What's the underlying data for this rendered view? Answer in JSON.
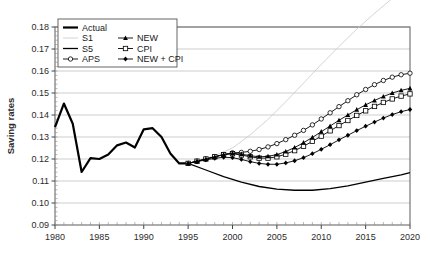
{
  "chart_data": {
    "type": "line",
    "title": "",
    "xlabel": "",
    "ylabel": "Saving rates",
    "xlim": [
      1980,
      2020
    ],
    "ylim": [
      0.09,
      0.18
    ],
    "yticks": [
      "0.09",
      "0.10",
      "0.11",
      "0.12",
      "0.13",
      "0.14",
      "0.15",
      "0.16",
      "0.17",
      "0.18"
    ],
    "xticks": [
      "1980",
      "1985",
      "1990",
      "1995",
      "2000",
      "2005",
      "2010",
      "2015",
      "2020"
    ],
    "x_minor_tick_step": 1,
    "grid": "horizontal",
    "legend_position": "top-left-inside",
    "legend_entries": [
      {
        "label": "Actual",
        "style": "thick-line",
        "marker": "none",
        "color": "#000000"
      },
      {
        "label": "S1",
        "style": "thin-line",
        "marker": "none",
        "color": "#c9c9c9"
      },
      {
        "label": "S5",
        "style": "medium-line",
        "marker": "none",
        "color": "#000000"
      },
      {
        "label": "APS",
        "style": "line-with-marker",
        "marker": "open-circle",
        "color": "#000000"
      },
      {
        "label": "NEW",
        "style": "line-with-marker",
        "marker": "filled-triangle",
        "color": "#000000"
      },
      {
        "label": "CPI",
        "style": "line-with-marker",
        "marker": "open-square",
        "color": "#000000"
      },
      {
        "label": "NEW + CPI",
        "style": "line-with-marker",
        "marker": "filled-diamond",
        "color": "#000000"
      }
    ],
    "series": [
      {
        "name": "Actual",
        "x": [
          1980,
          1981,
          1982,
          1983,
          1984,
          1985,
          1986,
          1987,
          1988,
          1989,
          1990,
          1991,
          1992,
          1993,
          1994,
          1995
        ],
        "values": [
          0.1345,
          0.1452,
          0.136,
          0.1141,
          0.1204,
          0.12,
          0.122,
          0.1262,
          0.1275,
          0.1252,
          0.1335,
          0.134,
          0.13,
          0.1225,
          0.118,
          0.118
        ]
      },
      {
        "name": "S1",
        "x": [
          1995,
          1998,
          2000,
          2002,
          2004,
          2006,
          2008,
          2010,
          2012,
          2014,
          2016,
          2018,
          2020
        ],
        "values": [
          0.118,
          0.1215,
          0.125,
          0.131,
          0.138,
          0.146,
          0.1545,
          0.163,
          0.1712,
          0.179,
          0.1862,
          0.193,
          0.1995
        ]
      },
      {
        "name": "S5",
        "x": [
          1995,
          1997,
          1999,
          2001,
          2003,
          2005,
          2007,
          2009,
          2011,
          2013,
          2015,
          2017,
          2019,
          2020
        ],
        "values": [
          0.118,
          0.115,
          0.112,
          0.1095,
          0.1075,
          0.1063,
          0.1058,
          0.1058,
          0.1065,
          0.1078,
          0.1095,
          0.1112,
          0.1128,
          0.1138
        ]
      },
      {
        "name": "APS",
        "x": [
          1995,
          1996,
          1997,
          1998,
          1999,
          2000,
          2001,
          2002,
          2003,
          2004,
          2005,
          2006,
          2007,
          2008,
          2009,
          2010,
          2011,
          2012,
          2013,
          2014,
          2015,
          2016,
          2017,
          2018,
          2019,
          2020
        ],
        "values": [
          0.118,
          0.119,
          0.12,
          0.121,
          0.122,
          0.1228,
          0.123,
          0.1235,
          0.1243,
          0.1255,
          0.127,
          0.1288,
          0.1308,
          0.133,
          0.1355,
          0.1382,
          0.141,
          0.1438,
          0.1465,
          0.1492,
          0.1516,
          0.1538,
          0.1557,
          0.1572,
          0.1583,
          0.159
        ]
      },
      {
        "name": "NEW",
        "x": [
          1995,
          1996,
          1997,
          1998,
          1999,
          2000,
          2001,
          2002,
          2003,
          2004,
          2005,
          2006,
          2007,
          2008,
          2009,
          2010,
          2011,
          2012,
          2013,
          2014,
          2015,
          2016,
          2017,
          2018,
          2019,
          2020
        ],
        "values": [
          0.118,
          0.119,
          0.12,
          0.121,
          0.122,
          0.1226,
          0.1222,
          0.1215,
          0.121,
          0.1212,
          0.122,
          0.1234,
          0.1252,
          0.1274,
          0.1298,
          0.1324,
          0.135,
          0.1376,
          0.14,
          0.1424,
          0.1446,
          0.1466,
          0.1484,
          0.15,
          0.1512,
          0.1521
        ]
      },
      {
        "name": "CPI",
        "x": [
          1995,
          1996,
          1997,
          1998,
          1999,
          2000,
          2001,
          2002,
          2003,
          2004,
          2005,
          2006,
          2007,
          2008,
          2009,
          2010,
          2011,
          2012,
          2013,
          2014,
          2015,
          2016,
          2017,
          2018,
          2019,
          2020
        ],
        "values": [
          0.118,
          0.119,
          0.12,
          0.121,
          0.122,
          0.1224,
          0.1218,
          0.121,
          0.1204,
          0.1204,
          0.121,
          0.1222,
          0.1238,
          0.1258,
          0.128,
          0.1304,
          0.1328,
          0.1352,
          0.1375,
          0.1398,
          0.1419,
          0.1439,
          0.1457,
          0.1473,
          0.1486,
          0.1496
        ]
      },
      {
        "name": "NEW + CPI",
        "x": [
          1995,
          1996,
          1997,
          1998,
          1999,
          2000,
          2001,
          2002,
          2003,
          2004,
          2005,
          2006,
          2007,
          2008,
          2009,
          2010,
          2011,
          2012,
          2013,
          2014,
          2015,
          2016,
          2017,
          2018,
          2019,
          2020
        ],
        "values": [
          0.118,
          0.1188,
          0.1196,
          0.1203,
          0.1208,
          0.1206,
          0.1198,
          0.1188,
          0.118,
          0.1176,
          0.1176,
          0.1182,
          0.1192,
          0.1206,
          0.1224,
          0.1244,
          0.1265,
          0.1287,
          0.1308,
          0.1329,
          0.1349,
          0.1368,
          0.1386,
          0.1402,
          0.1415,
          0.1425
        ]
      }
    ]
  }
}
